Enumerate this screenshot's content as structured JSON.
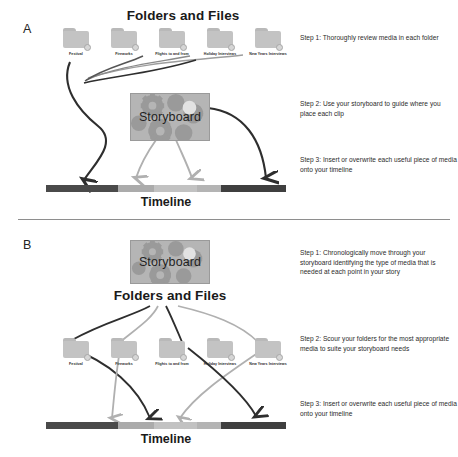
{
  "panels": [
    {
      "letter": "A",
      "heading": "Folders and Files",
      "storyboard_label": "Storyboard",
      "timeline_label": "Timeline",
      "folders": [
        {
          "label": "Festival"
        },
        {
          "label": "Fireworks"
        },
        {
          "label": "Flights to and from"
        },
        {
          "label": "Holiday Interviews"
        },
        {
          "label": "New Years Interviews"
        }
      ],
      "steps": [
        {
          "text": "Step 1: Thoroughly review media in each folder"
        },
        {
          "text": "Step 2: Use your storyboard to guide where you place each clip"
        },
        {
          "text": "Step 3: Insert or overwrite each useful piece of media onto your timeline"
        }
      ]
    },
    {
      "letter": "B",
      "heading": "Folders and Files",
      "storyboard_label": "Storyboard",
      "timeline_label": "Timeline",
      "folders": [
        {
          "label": "Festival"
        },
        {
          "label": "Fireworks"
        },
        {
          "label": "Flights to and from"
        },
        {
          "label": "Holiday Interviews"
        },
        {
          "label": "New Years Interviews"
        }
      ],
      "steps": [
        {
          "text": "Step 1: Chronologically move through your storyboard identifying the type of media that is needed at each point in your story"
        },
        {
          "text": "Step 2: Scour your folders for the most appropriate media to suite your storyboard needs"
        },
        {
          "text": "Step 3: Insert or overwrite each useful piece of media onto your timeline"
        }
      ]
    }
  ],
  "timeline_segments": [
    {
      "name": "clip-dark-1",
      "color": "#4a4a4a",
      "width_pct": 30
    },
    {
      "name": "clip-light-1",
      "color": "#ababab",
      "width_pct": 15
    },
    {
      "name": "clip-light-2",
      "color": "#c2c2c2",
      "width_pct": 18
    },
    {
      "name": "clip-light-3",
      "color": "#b4b4b4",
      "width_pct": 10
    },
    {
      "name": "clip-dark-2",
      "color": "#3f3f3f",
      "width_pct": 27
    }
  ],
  "colors": {
    "arrow_dark": "#2e2e2e",
    "arrow_light": "#b0b0b0",
    "folder": "#c3c3c3",
    "storyboard_bg": "#b5b5b5",
    "gear": "#9a9a9a",
    "divider": "#8e8e8e",
    "text": "#2b2b2b"
  }
}
